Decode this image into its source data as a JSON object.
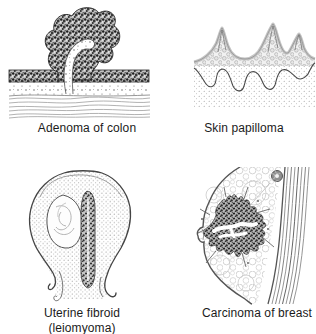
{
  "figure": {
    "panels": [
      {
        "name": "adenoma-of-colon",
        "caption": "Adenoma of colon"
      },
      {
        "name": "skin-papilloma",
        "caption": "Skin papilloma"
      },
      {
        "name": "uterine-fibroid",
        "caption": "Uterine fibroid",
        "caption2": "(leiomyoma)"
      },
      {
        "name": "carcinoma-of-breast",
        "caption": "Carcinoma of breast"
      }
    ]
  },
  "colors": {
    "ink": "#2a2a2a",
    "line_gray": "#777777",
    "texture_gray": "#c2c2c2",
    "background": "#ffffff"
  }
}
